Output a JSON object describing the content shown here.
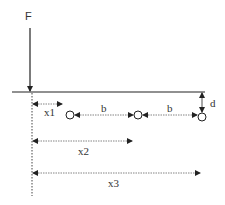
{
  "diagram": {
    "force": {
      "label": "F",
      "x": 30,
      "y_top": 28,
      "y_bottom": 92
    },
    "beam": {
      "y": 92,
      "x_start": 12,
      "x_end": 205
    },
    "reference_line": {
      "x": 32,
      "y_top": 92,
      "y_bottom": 196,
      "style": "dotted"
    },
    "supports": [
      {
        "name": "support-1",
        "cx": 70,
        "cy": 115
      },
      {
        "name": "support-2",
        "cx": 138,
        "cy": 115
      },
      {
        "name": "support-3",
        "cx": 202,
        "cy": 117
      }
    ],
    "dimensions": {
      "x1": {
        "label": "x1",
        "y": 104
      },
      "b1": {
        "label": "b"
      },
      "b2": {
        "label": "b"
      },
      "d": {
        "label": "d"
      },
      "x2": {
        "label": "x2",
        "y": 141
      },
      "x3": {
        "label": "x3",
        "y": 173
      }
    },
    "colors": {
      "line": "#222222",
      "dim": "#555555",
      "background": "#ffffff"
    }
  }
}
